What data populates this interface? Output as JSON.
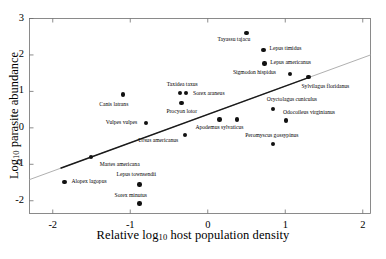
{
  "figure": {
    "title": "",
    "x_axis_title_prefix": "Relative log",
    "x_axis_title_sub": "10",
    "x_axis_title_suffix": " host population density",
    "y_axis_title_prefix": "Log",
    "y_axis_title_sub": "10",
    "y_axis_title_suffix": " parasite abundance"
  },
  "chart_data": {
    "type": "scatter",
    "title": "",
    "xlabel": "Relative log10 host population density",
    "ylabel": "Log10 parasite abundance",
    "xlim": [
      -2.3,
      2.1
    ],
    "ylim": [
      -2.35,
      3.0
    ],
    "xticks": [
      -2,
      -1,
      0,
      1,
      2
    ],
    "xticklabels": [
      "-2",
      "-1",
      "0",
      "1",
      "2"
    ],
    "yticks": [
      -2,
      -1,
      0,
      1,
      2,
      3
    ],
    "yticklabels": [
      "-2",
      "-1",
      "0",
      "1",
      "2",
      "3"
    ],
    "grid": false,
    "legend": null,
    "marker": "filled-circle",
    "marker_color": "#111111",
    "trendline": {
      "color": "#1a1a1a",
      "extension_color": "#b0b0b0",
      "x_start": -2.3,
      "y_start": -1.42,
      "x_end": 2.1,
      "y_end": 2.0,
      "solid_x_start": -1.9,
      "solid_x_end": 1.3
    },
    "points": [
      {
        "name": "Tayassu tajacu",
        "x": 0.5,
        "y": 2.6,
        "label_dx": -29,
        "label_dy": 7
      },
      {
        "name": "Lepus timidus",
        "x": 0.72,
        "y": 2.14,
        "label_dx": 6,
        "label_dy": -1
      },
      {
        "name": "Lepus americanus",
        "x": 0.73,
        "y": 1.76,
        "label_dx": 6,
        "label_dy": -1
      },
      {
        "name": "Sigmodon hispidus",
        "x": 1.06,
        "y": 1.47,
        "label_dx": -57,
        "label_dy": -1
      },
      {
        "name": "Sylvilagus floridanus",
        "x": 1.3,
        "y": 1.39,
        "label_dx": -7,
        "label_dy": 10
      },
      {
        "name": "Canis latrans",
        "x": -1.09,
        "y": 0.92,
        "label_dx": -24,
        "label_dy": 11
      },
      {
        "name": "Taxidea taxus",
        "x": -0.36,
        "y": 0.96,
        "label_dx": -13,
        "label_dy": -8
      },
      {
        "name": "Sorex araneus",
        "x": -0.28,
        "y": 0.95,
        "label_dx": 7,
        "label_dy": 1
      },
      {
        "name": "Procyon lotor",
        "x": -0.34,
        "y": 0.68,
        "label_dx": -15,
        "label_dy": 9
      },
      {
        "name": "Oryctolagus cuniculus",
        "x": 0.84,
        "y": 0.52,
        "label_dx": -6,
        "label_dy": -9
      },
      {
        "name": "Odocoileus virginianus",
        "x": 1.01,
        "y": 0.2,
        "label_dx": -3,
        "label_dy": -8
      },
      {
        "name": "Vulpes vulpes",
        "x": -0.8,
        "y": 0.13,
        "label_dx": -40,
        "label_dy": 0
      },
      {
        "name": "Apodemus sylvaticus",
        "x": 0.15,
        "y": 0.23,
        "label_dx": -24,
        "label_dy": 9
      },
      {
        "name": "Ursus americanus",
        "x": -0.29,
        "y": -0.19,
        "label_dx": -47,
        "label_dy": 6
      },
      {
        "name": "Peromyscus gossypinus",
        "x": 0.38,
        "y": 0.23,
        "label_dx": 8,
        "label_dy": 17
      },
      {
        "name": "Peromyscus gossypinus2",
        "x": 0.84,
        "y": -0.45,
        "label_dx": 0,
        "label_dy": 0,
        "hide_label": true
      },
      {
        "name": "Martes americana",
        "x": -1.51,
        "y": -0.8,
        "label_dx": 9,
        "label_dy": 8
      },
      {
        "name": "Alopex lagopus",
        "x": -1.85,
        "y": -1.49,
        "label_dx": 7,
        "label_dy": 0
      },
      {
        "name": "Lepus townsendii",
        "x": -0.88,
        "y": -1.55,
        "label_dx": -23,
        "label_dy": -9
      },
      {
        "name": "Sorex minutus",
        "x": -0.88,
        "y": -2.08,
        "label_dx": -25,
        "label_dy": -8
      }
    ]
  }
}
